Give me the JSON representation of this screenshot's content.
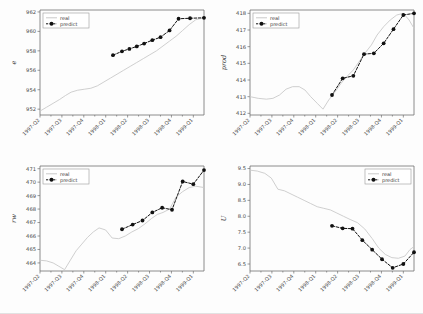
{
  "figure": {
    "width": 423,
    "height": 314,
    "background": "#fdfdfd",
    "layout": "2x2 grid of line plots",
    "colors": {
      "real": "#c9c9c9",
      "predict": "#111111",
      "axis": "#6e6e6e",
      "text": "#3a3a3a"
    }
  },
  "legend": {
    "entries": [
      {
        "label": "real",
        "style": "solid-light-gray-line",
        "color": "#c9c9c9"
      },
      {
        "label": "predict",
        "style": "black-dashed-line-with-round-markers",
        "color": "#111111"
      }
    ]
  },
  "shared": {
    "xticklabels": [
      "1997-Q2",
      "1997-Q3",
      "1997-Q4",
      "1998-Q1",
      "1998-Q2",
      "1998-Q3",
      "1998-Q4",
      "1999-Q1"
    ]
  },
  "chart_data": [
    {
      "type": "line",
      "title": "",
      "panel": "top-left",
      "ylabel": "e",
      "xlabel": "",
      "grid": false,
      "legend_position": "upper-left",
      "ylim": [
        951.4,
        962.2
      ],
      "yticks": [
        952,
        954,
        956,
        958,
        960,
        962
      ],
      "x": [
        "1997-Q2",
        "1997-Q3",
        "1997-Q4",
        "1998-Q1",
        "1998-Q2",
        "1998-Q3",
        "1998-Q4",
        "1999-Q1"
      ],
      "series": [
        {
          "name": "real",
          "x_fraction": [
            0.0,
            0.04,
            0.08,
            0.12,
            0.155,
            0.19,
            0.23,
            0.27,
            0.31,
            0.35,
            0.39,
            0.43,
            0.47,
            0.51,
            0.55,
            0.59,
            0.63,
            0.67,
            0.71,
            0.75,
            0.79,
            0.83,
            0.87,
            0.91,
            0.95,
            1.0
          ],
          "values": [
            951.8,
            952.2,
            952.6,
            953.0,
            953.4,
            953.75,
            953.95,
            954.05,
            954.15,
            954.4,
            954.8,
            955.2,
            955.6,
            956.0,
            956.4,
            956.8,
            957.2,
            957.6,
            958.0,
            958.5,
            959.0,
            959.5,
            960.1,
            960.7,
            961.2,
            961.4
          ]
        },
        {
          "name": "predict",
          "x_fraction": [
            0.445,
            0.5,
            0.545,
            0.59,
            0.635,
            0.685,
            0.735,
            0.79,
            0.845,
            0.915,
            1.0
          ],
          "values": [
            957.55,
            957.95,
            958.2,
            958.45,
            958.75,
            959.1,
            959.4,
            960.1,
            961.3,
            961.35,
            961.4
          ]
        }
      ]
    },
    {
      "type": "line",
      "title": "",
      "panel": "top-right",
      "ylabel": "prod",
      "xlabel": "",
      "grid": false,
      "legend_position": "upper-left",
      "ylim": [
        411.9,
        418.2
      ],
      "yticks": [
        412,
        413,
        414,
        415,
        416,
        417,
        418
      ],
      "x": [
        "1997-Q2",
        "1997-Q3",
        "1997-Q4",
        "1998-Q1",
        "1998-Q2",
        "1998-Q3",
        "1998-Q4",
        "1999-Q1"
      ],
      "series": [
        {
          "name": "real",
          "x_fraction": [
            0.0,
            0.05,
            0.1,
            0.14,
            0.18,
            0.22,
            0.26,
            0.3,
            0.335,
            0.37,
            0.41,
            0.445,
            0.48,
            0.52,
            0.555,
            0.59,
            0.63,
            0.665,
            0.7,
            0.74,
            0.775,
            0.815,
            0.855,
            0.895,
            0.935,
            0.97,
            1.0
          ],
          "values": [
            413.0,
            412.9,
            412.85,
            412.9,
            413.1,
            413.45,
            413.6,
            413.6,
            413.4,
            413.0,
            412.6,
            412.25,
            412.8,
            413.3,
            413.8,
            414.2,
            414.6,
            415.1,
            415.6,
            416.1,
            416.7,
            417.2,
            417.6,
            417.9,
            418.0,
            417.6,
            417.1
          ]
        },
        {
          "name": "predict",
          "x_fraction": [
            0.5,
            0.565,
            0.63,
            0.695,
            0.755,
            0.815,
            0.875,
            0.935,
            1.0
          ],
          "values": [
            413.1,
            414.1,
            414.25,
            415.55,
            415.6,
            416.2,
            417.05,
            417.9,
            418.0
          ]
        }
      ]
    },
    {
      "type": "line",
      "title": "",
      "panel": "bottom-left",
      "ylabel": "rw",
      "xlabel": "",
      "grid": false,
      "legend_position": "upper-left",
      "ylim": [
        463.4,
        471.2
      ],
      "yticks": [
        464,
        465,
        466,
        467,
        468,
        469,
        470,
        471
      ],
      "x": [
        "1997-Q2",
        "1997-Q3",
        "1997-Q4",
        "1998-Q1",
        "1998-Q2",
        "1998-Q3",
        "1998-Q4",
        "1999-Q1"
      ],
      "series": [
        {
          "name": "real",
          "x_fraction": [
            0.0,
            0.04,
            0.08,
            0.115,
            0.15,
            0.185,
            0.22,
            0.255,
            0.29,
            0.325,
            0.36,
            0.4,
            0.44,
            0.48,
            0.52,
            0.56,
            0.6,
            0.64,
            0.68,
            0.715,
            0.75,
            0.79,
            0.83,
            0.87,
            0.91,
            0.95,
            1.0
          ],
          "values": [
            464.2,
            464.15,
            464.0,
            463.75,
            463.5,
            464.2,
            464.9,
            465.4,
            465.9,
            466.3,
            466.6,
            466.45,
            465.85,
            465.8,
            466.0,
            466.3,
            466.55,
            466.9,
            467.3,
            467.6,
            467.75,
            468.0,
            468.9,
            469.3,
            469.6,
            469.7,
            469.6
          ]
        },
        {
          "name": "predict",
          "x_fraction": [
            0.5,
            0.565,
            0.625,
            0.685,
            0.745,
            0.805,
            0.87,
            0.935,
            1.0
          ],
          "values": [
            466.5,
            466.85,
            467.15,
            467.75,
            468.1,
            467.95,
            470.05,
            469.85,
            470.9
          ]
        }
      ]
    },
    {
      "type": "line",
      "title": "",
      "panel": "bottom-right",
      "ylabel": "U",
      "xlabel": "",
      "grid": false,
      "legend_position": "upper-right",
      "ylim": [
        6.28,
        9.58
      ],
      "yticks": [
        6.5,
        7.0,
        7.5,
        8.0,
        8.5,
        9.0,
        9.5
      ],
      "x": [
        "1997-Q2",
        "1997-Q3",
        "1997-Q4",
        "1998-Q1",
        "1998-Q2",
        "1998-Q3",
        "1998-Q4",
        "1999-Q1"
      ],
      "series": [
        {
          "name": "real",
          "x_fraction": [
            0.0,
            0.045,
            0.09,
            0.13,
            0.17,
            0.21,
            0.25,
            0.29,
            0.33,
            0.37,
            0.41,
            0.45,
            0.49,
            0.53,
            0.57,
            0.61,
            0.655,
            0.7,
            0.745,
            0.785,
            0.825,
            0.865,
            0.905,
            0.945,
            0.975,
            1.0
          ],
          "values": [
            9.45,
            9.42,
            9.35,
            9.2,
            8.85,
            8.8,
            8.7,
            8.6,
            8.5,
            8.4,
            8.3,
            8.25,
            8.2,
            8.1,
            8.0,
            7.9,
            7.8,
            7.6,
            7.3,
            7.0,
            6.8,
            6.7,
            6.68,
            6.75,
            6.95,
            7.05
          ]
        },
        {
          "name": "predict",
          "x_fraction": [
            0.5,
            0.565,
            0.625,
            0.685,
            0.745,
            0.805,
            0.87,
            0.935,
            1.0
          ],
          "values": [
            7.7,
            7.62,
            7.61,
            7.25,
            6.95,
            6.65,
            6.38,
            6.5,
            6.87
          ]
        }
      ]
    }
  ]
}
